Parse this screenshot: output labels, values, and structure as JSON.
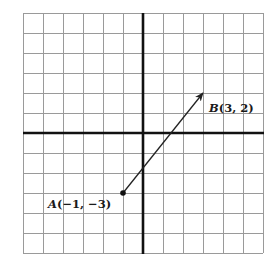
{
  "diagram": {
    "type": "coordinate-plane",
    "grid": {
      "columns": 12,
      "rows": 12,
      "x_range": [
        -6,
        6
      ],
      "y_range": [
        -6,
        6
      ],
      "cell_size_px": 20,
      "origin_px": [
        143,
        133
      ],
      "left_px": 23,
      "top_px": 13,
      "grid_color": "#9a9a9a",
      "axis_color": "#111111"
    },
    "points": [
      {
        "id": "A",
        "name": "A",
        "x": -1,
        "y": -3,
        "label_text": "(−1, −3)",
        "marker": "filled-dot"
      },
      {
        "id": "B",
        "name": "B",
        "x": 3,
        "y": 2,
        "label_text": "(3, 2)",
        "marker": "arrowhead"
      }
    ],
    "vector": {
      "from": "A",
      "to": "B",
      "description": "Directed segment from A(-1, -3) to B(3, 2)"
    }
  }
}
